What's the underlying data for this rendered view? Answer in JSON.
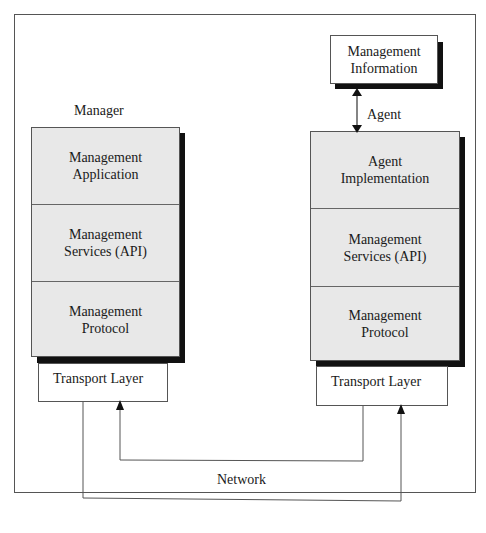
{
  "manager": {
    "label": "Manager",
    "layers": [
      {
        "text": "Management\nApplication"
      },
      {
        "text": "Management\nServices (API)"
      },
      {
        "text": "Management\nProtocol"
      }
    ],
    "transport": "Transport Layer"
  },
  "agent": {
    "label": "Agent",
    "info_box": "Management\nInformation",
    "layers": [
      {
        "text": "Agent\nImplementation"
      },
      {
        "text": "Management\nServices (API)"
      },
      {
        "text": "Management\nProtocol"
      }
    ],
    "transport": "Transport Layer"
  },
  "network": {
    "label": "Network"
  },
  "colors": {
    "layer_fill": "#e8e8e8",
    "shadow": "#111111",
    "line": "#555555"
  }
}
